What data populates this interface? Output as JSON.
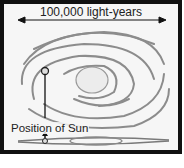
{
  "diagram": {
    "scale_label": "100,000 light-years",
    "sun_label": "Position of Sun",
    "colors": {
      "frame": "#111111",
      "background": "#f6f6f6",
      "arms": "#777777",
      "text": "#222222"
    }
  }
}
